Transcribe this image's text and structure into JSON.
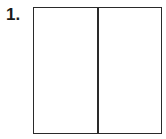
{
  "problem": {
    "number_label": "1.",
    "figure": {
      "shape": "rectangle",
      "parts": 2,
      "division": "vertical",
      "shaded_parts": 0
    }
  }
}
